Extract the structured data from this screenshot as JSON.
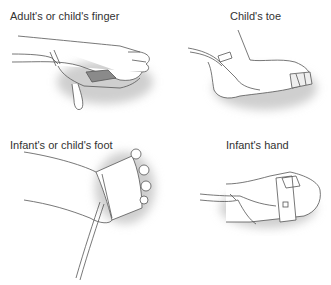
{
  "figure": {
    "panels": [
      {
        "id": "finger",
        "caption": "Adult's or child's finger"
      },
      {
        "id": "toe",
        "caption": "Child's toe"
      },
      {
        "id": "foot",
        "caption": "Infant's or child's foot"
      },
      {
        "id": "hand",
        "caption": "Infant's hand"
      }
    ],
    "colors": {
      "line": "#555555",
      "shadow": "#bdbdbd",
      "sensor": "#8a8a8a",
      "background": "#ffffff"
    }
  }
}
